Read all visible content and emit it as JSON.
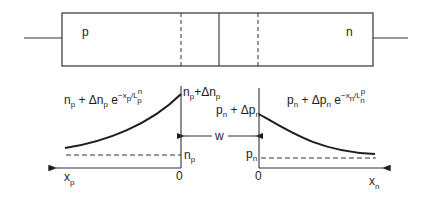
{
  "diagram": {
    "device": {
      "regions": [
        {
          "id": "p",
          "label": "p"
        },
        {
          "id": "n",
          "label": "n"
        }
      ]
    },
    "left_plot": {
      "curve_label": {
        "base": "n",
        "base_sub": "p",
        "plus": " + Δn",
        "delta_sub": "p",
        "exp": " e",
        "exp_sup_pre": "−x",
        "exp_sup_sub": "p",
        "exp_sup_mid": "/L",
        "exp_sup_sup": "n",
        "exp_sup_sub2": "p"
      },
      "top_label": {
        "a": "n",
        "a_sub": "p",
        "b": "+Δn",
        "b_sub": "p"
      },
      "baseline_label": {
        "a": "n",
        "a_sub": "p"
      },
      "origin_label": "0",
      "axis_label": {
        "a": "x",
        "a_sub": "p"
      }
    },
    "right_plot": {
      "curve_label": {
        "base": "p",
        "base_sub": "n",
        "plus": " + Δp",
        "delta_sub": "n",
        "exp": " e",
        "exp_sup_pre": "−x",
        "exp_sup_sub": "n",
        "exp_sup_mid": "/L",
        "exp_sup_sup": "p",
        "exp_sup_sub2": "n"
      },
      "top_label": {
        "a": "p",
        "a_sub": "n",
        "b": " + Δp",
        "b_sub": "n"
      },
      "baseline_label": {
        "a": "p",
        "a_sub": "n"
      },
      "origin_label": "0",
      "axis_label": {
        "a": "x",
        "a_sub": "n"
      }
    },
    "depletion_width_label": "w"
  }
}
